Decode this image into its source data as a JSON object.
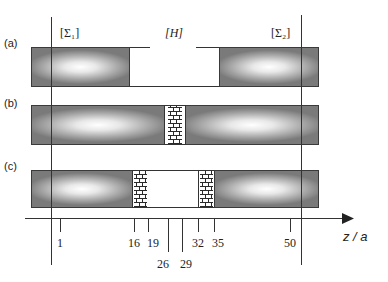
{
  "figure": {
    "rows": [
      {
        "id": "a",
        "label": "(a)"
      },
      {
        "id": "b",
        "label": "(b)"
      },
      {
        "id": "c",
        "label": "(c)"
      }
    ],
    "region_labels": {
      "sigma1": "[Σ₁]",
      "heterostructure": "[H]",
      "sigma2": "[Σ₂]"
    },
    "axis": {
      "label": "z / a",
      "ticks": [
        {
          "value": "1",
          "x": 60,
          "long": false
        },
        {
          "value": "16",
          "x": 134,
          "long": false
        },
        {
          "value": "19",
          "x": 148,
          "long": false
        },
        {
          "value": "26",
          "x": 168,
          "long": true
        },
        {
          "value": "29",
          "x": 182,
          "long": true
        },
        {
          "value": "32",
          "x": 198,
          "long": false
        },
        {
          "value": "35",
          "x": 214,
          "long": false
        },
        {
          "value": "50",
          "x": 290,
          "long": false
        }
      ]
    },
    "colors": {
      "line": "#333333",
      "box_edge": "#7a7a7a",
      "box_center": "#ffffff"
    }
  }
}
